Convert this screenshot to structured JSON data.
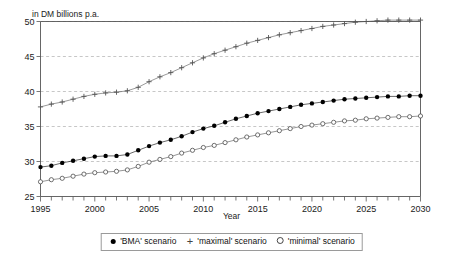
{
  "figure": {
    "unit_title": "in DM billions p.a.",
    "xlabel": "Year",
    "background": "#ffffff",
    "grid_color": "#b9b9b9",
    "frame_color": "#555555"
  },
  "legend": {
    "items": [
      {
        "symbol": "filled-circle",
        "label": "'BMA' scenario"
      },
      {
        "symbol": "plus",
        "label": "'maximal' scenario"
      },
      {
        "symbol": "open-circle",
        "label": "'minimal' scenario"
      }
    ]
  },
  "chart_data": {
    "type": "line",
    "title": "in DM billions p.a.",
    "xlabel": "Year",
    "ylabel": "",
    "xlim": [
      1995,
      2030
    ],
    "ylim": [
      25,
      50
    ],
    "xticks": [
      1995,
      2000,
      2005,
      2010,
      2015,
      2020,
      2025,
      2030
    ],
    "xtick_labels": [
      "1995",
      "2000",
      "2005",
      "2010",
      "2015",
      "2020",
      "2025",
      "2030"
    ],
    "yticks": [
      25,
      30,
      35,
      40,
      45,
      50
    ],
    "ytick_labels": [
      "25",
      "30",
      "35",
      "40",
      "45",
      "50"
    ],
    "minor_xtick_interval": 1,
    "grid": true,
    "grid_axis": "y",
    "legend_position": "below",
    "x": [
      1995,
      1996,
      1997,
      1998,
      1999,
      2000,
      2001,
      2002,
      2003,
      2004,
      2005,
      2006,
      2007,
      2008,
      2009,
      2010,
      2011,
      2012,
      2013,
      2014,
      2015,
      2016,
      2017,
      2018,
      2019,
      2020,
      2021,
      2022,
      2023,
      2024,
      2025,
      2026,
      2027,
      2028,
      2029,
      2030
    ],
    "series": [
      {
        "name": "'BMA' scenario",
        "marker": "filled-circle",
        "color": "#000000",
        "values": [
          29.2,
          29.4,
          29.8,
          30.1,
          30.4,
          30.7,
          30.8,
          30.8,
          31.0,
          31.6,
          32.2,
          32.7,
          33.1,
          33.6,
          34.2,
          34.7,
          35.1,
          35.6,
          36.1,
          36.5,
          36.9,
          37.2,
          37.5,
          37.8,
          38.1,
          38.3,
          38.5,
          38.7,
          38.9,
          39.0,
          39.1,
          39.2,
          39.3,
          39.3,
          39.4,
          39.4
        ]
      },
      {
        "name": "'maximal' scenario",
        "marker": "plus",
        "color": "#555555",
        "values": [
          37.8,
          38.2,
          38.5,
          38.9,
          39.3,
          39.6,
          39.8,
          39.9,
          40.1,
          40.6,
          41.4,
          42.1,
          42.7,
          43.4,
          44.1,
          44.8,
          45.4,
          45.9,
          46.4,
          46.9,
          47.3,
          47.7,
          48.1,
          48.4,
          48.7,
          49.0,
          49.3,
          49.5,
          49.7,
          49.9,
          50.0,
          50.1,
          50.2,
          50.2,
          50.2,
          50.2
        ]
      },
      {
        "name": "'minimal' scenario",
        "marker": "open-circle",
        "color": "#4d4d4d",
        "values": [
          27.1,
          27.4,
          27.6,
          27.9,
          28.2,
          28.4,
          28.5,
          28.6,
          28.8,
          29.3,
          29.9,
          30.3,
          30.7,
          31.2,
          31.6,
          32.0,
          32.3,
          32.7,
          33.1,
          33.5,
          33.8,
          34.1,
          34.4,
          34.7,
          35.0,
          35.2,
          35.4,
          35.6,
          35.8,
          35.9,
          36.1,
          36.2,
          36.3,
          36.4,
          36.4,
          36.5
        ]
      }
    ]
  }
}
